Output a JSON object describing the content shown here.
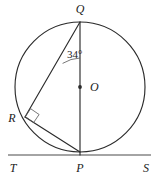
{
  "figure": {
    "background_color": "#ffffff",
    "stroke_color": "#2b2b2b",
    "thin_stroke_color": "#555555",
    "width": 158,
    "height": 176
  },
  "circle": {
    "name": "circle-O",
    "center_x": 80,
    "center_y": 87,
    "radius": 65
  },
  "points": {
    "Q": {
      "label": "Q",
      "x": 80,
      "y": 22,
      "label_x": 80,
      "label_y": 13
    },
    "P": {
      "label": "P",
      "x": 80,
      "y": 152,
      "label_x": 80,
      "label_y": 172
    },
    "R": {
      "label": "R",
      "x": 25,
      "y": 117,
      "label_x": 12,
      "label_y": 122
    },
    "O": {
      "label": "O",
      "x": 80,
      "y": 87,
      "label_x": 90,
      "label_y": 91
    },
    "T": {
      "label": "T",
      "x": 9,
      "y": 155,
      "label_x": 13,
      "label_y": 172
    },
    "S": {
      "label": "S",
      "x": 150,
      "y": 155,
      "label_x": 146,
      "label_y": 172
    }
  },
  "segments": [
    {
      "name": "chord-QP-diameter",
      "from": "Q",
      "to": "P"
    },
    {
      "name": "chord-QR",
      "from": "Q",
      "to": "R"
    },
    {
      "name": "chord-RP",
      "from": "R",
      "to": "P"
    }
  ],
  "tangent_line": {
    "name": "tangent-TS",
    "from_label": "T",
    "to_label": "S",
    "x1": 8,
    "y1": 155,
    "x2": 151,
    "y2": 155,
    "touch_point": "P"
  },
  "angles": [
    {
      "name": "angle-RQP",
      "vertex": "Q",
      "value_text": "34°",
      "degrees": 34,
      "label_x": 67,
      "label_y": 58,
      "arc_path": "M 62.6 63.4 A 36 36 0 0 1 80 58"
    },
    {
      "name": "right-angle-QRP",
      "vertex": "R",
      "value_text": "90°",
      "degrees": 90,
      "marker_path": "M 30.6 108.7 L 39.1 114.5 L 33.6 122.6 L 25.4 116.6 Z"
    }
  ]
}
